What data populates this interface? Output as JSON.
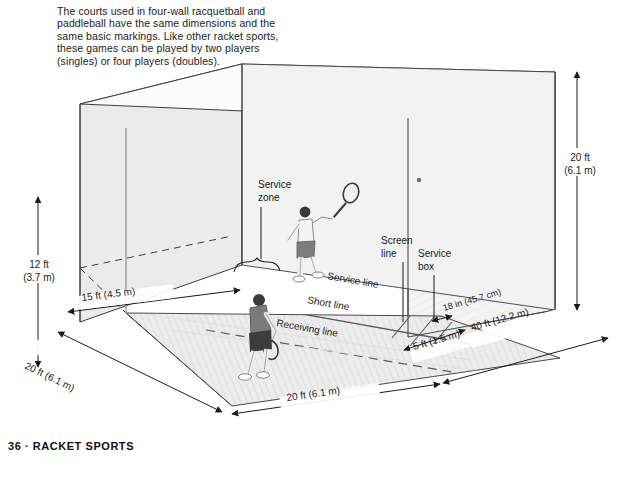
{
  "page": {
    "footer": "36 · RACKET SPORTS",
    "intro_paragraph": "The courts used in four-wall racquetball and paddleball have the same dimensions and the same basic markings. Like other racket sports, these games can be played by two players (singles) or four players (doubles)."
  },
  "figure": {
    "court_labels": {
      "service_zone_line1": "Service",
      "service_zone_line2": "zone",
      "screen_line_line1": "Screen",
      "screen_line_line2": "line",
      "service_box_line1": "Service",
      "service_box_line2": "box",
      "service_line": "Service line",
      "short_line": "Short line",
      "receiving_line": "Receiving line"
    },
    "dimensions": {
      "height_back_ft": "12 ft",
      "height_back_m": "(3.7 m)",
      "height_front_ft": "20 ft",
      "height_front_m": "(6.1 m)",
      "service_zone_depth": "15 ft (4.5 m)",
      "court_width_back": "20 ft (6.1 m)",
      "court_width_front": "20 ft (6.1 m)",
      "court_length": "40 ft (12.2 m)",
      "screen_offset": "5 ft (1.5 m)",
      "service_box_width": "18 in (45.7 cm)"
    }
  },
  "colors": {
    "floor": "#e9e9e9",
    "wall_left": "#e4e4e4",
    "wall_back": "#efefef",
    "wall_right": "#f4f4f4",
    "line": "#444444",
    "text": "#1b1b1b",
    "player_shirt_dark": "#6b6b6b",
    "player_shirt_light": "#f2f2f2"
  }
}
